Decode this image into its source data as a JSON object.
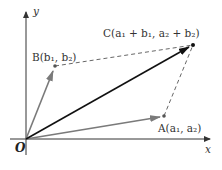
{
  "diagram": {
    "axes": {
      "x_label": "x",
      "y_label": "y",
      "origin_label": "O"
    },
    "points": {
      "O": {
        "label": "O",
        "px": [
          26,
          139
        ]
      },
      "A": {
        "name": "A",
        "coords": "(a1, a2)",
        "px": [
          164,
          116
        ],
        "display": "A(a₁, a₂)"
      },
      "B": {
        "name": "B",
        "coords": "(b1, b2)",
        "px": [
          55,
          66
        ],
        "display": "B(b₁, b₂)"
      },
      "C": {
        "name": "C",
        "coords": "(a1 + b1, a2 + b2)",
        "px": [
          193,
          45
        ],
        "display": "C(a₁ + b₁, a₂ + b₂)"
      }
    },
    "vectors": [
      {
        "from": "O",
        "to": "A",
        "style": "solid",
        "color": "#7a7a7a"
      },
      {
        "from": "O",
        "to": "B",
        "style": "solid",
        "color": "#7a7a7a"
      },
      {
        "from": "O",
        "to": "C",
        "style": "solid",
        "color": "#111111"
      }
    ],
    "dashed_segments": [
      {
        "from": "B",
        "to": "C",
        "color": "#555555"
      },
      {
        "from": "A",
        "to": "C",
        "color": "#555555"
      }
    ],
    "colors": {
      "axis": "#333333",
      "gray_vector": "#7a7a7a",
      "sum_vector": "#111111",
      "dashed": "#555555"
    }
  }
}
